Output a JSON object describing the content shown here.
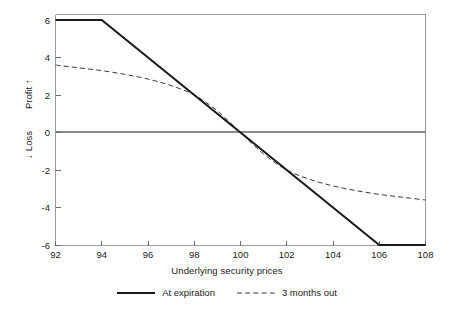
{
  "chart_data": {
    "type": "line",
    "title": "",
    "xlabel": "Underlying security prices",
    "ylabel": "Profit / Loss",
    "ylabel_upper": "Profit",
    "ylabel_lower": "Loss",
    "xlim": [
      92,
      108
    ],
    "ylim": [
      -6,
      6
    ],
    "xticks": [
      92,
      94,
      96,
      98,
      100,
      102,
      104,
      106,
      108
    ],
    "yticks": [
      6,
      4,
      2,
      0,
      -2,
      -4,
      -6
    ],
    "xtick_labels": [
      "92",
      "94",
      "96",
      "98",
      "100",
      "102",
      "104",
      "106",
      "108"
    ],
    "ytick_labels": [
      "6",
      "4",
      "2",
      "0",
      "-2",
      "-4",
      "-6"
    ],
    "grid": false,
    "zero_line": true,
    "legend_position": "below",
    "series": [
      {
        "name": "At expiration",
        "style": "solid",
        "color": "#1a1a1a",
        "width": 2,
        "x": [
          92,
          94,
          106,
          108
        ],
        "values": [
          6,
          6,
          -6,
          -6
        ]
      },
      {
        "name": "3 months out",
        "style": "dashed",
        "color": "#3a3a3a",
        "width": 1,
        "x": [
          92,
          93,
          94,
          95,
          96,
          97,
          98,
          99,
          100,
          101,
          102,
          103,
          104,
          105,
          106,
          107,
          108
        ],
        "values": [
          3.6,
          3.45,
          3.3,
          3.1,
          2.85,
          2.5,
          2.0,
          1.15,
          0.0,
          -1.15,
          -2.0,
          -2.5,
          -2.85,
          -3.1,
          -3.3,
          -3.45,
          -3.6
        ]
      }
    ]
  },
  "axes": {
    "x_title": "Underlying security prices",
    "y_title_upper": "Profit",
    "y_title_lower": "Loss",
    "arrow_up": "↑",
    "arrow_down": "↓",
    "arrow_up_name": "profit-arrow-icon",
    "arrow_down_name": "loss-arrow-icon"
  },
  "legend": {
    "items": [
      {
        "label": "At expiration",
        "style": "solid"
      },
      {
        "label": "3 months out",
        "style": "dashed"
      }
    ]
  },
  "colors": {
    "line_expiration": "#1a1a1a",
    "line_months_out": "#3a3a3a",
    "axis": "#9a9a9a",
    "zero_line": "#8a8a8a",
    "text": "#1a1a1a",
    "background": "#ffffff"
  }
}
